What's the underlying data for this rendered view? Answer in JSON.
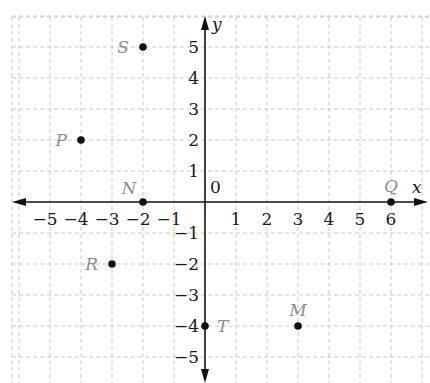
{
  "chart_data": {
    "type": "scatter",
    "title": "",
    "xlabel": "x",
    "ylabel": "y",
    "xlim": [
      -6,
      7
    ],
    "ylim": [
      -6,
      6
    ],
    "grid": true,
    "origin_label": "0",
    "x_ticks": [
      -5,
      -4,
      -3,
      -2,
      -1,
      1,
      2,
      3,
      4,
      5,
      6
    ],
    "y_ticks": [
      5,
      4,
      3,
      2,
      1,
      -1,
      -2,
      -3,
      -4,
      -5
    ],
    "x_tick_labels": [
      "-5",
      "-4",
      "-3",
      "-2",
      "-1",
      "1",
      "2",
      "3",
      "4",
      "5",
      "6"
    ],
    "y_tick_labels": [
      "5",
      "4",
      "3",
      "2",
      "1",
      "-1",
      "-2",
      "-3",
      "-4",
      "-5"
    ],
    "points": [
      {
        "label": "S",
        "x": -2,
        "y": 5,
        "label_pos": "left"
      },
      {
        "label": "P",
        "x": -4,
        "y": 2,
        "label_pos": "left"
      },
      {
        "label": "N",
        "x": -2,
        "y": 0,
        "label_pos": "above-left"
      },
      {
        "label": "Q",
        "x": 6,
        "y": 0,
        "label_pos": "above"
      },
      {
        "label": "R",
        "x": -3,
        "y": -2,
        "label_pos": "left"
      },
      {
        "label": "T",
        "x": 0,
        "y": -4,
        "label_pos": "right"
      },
      {
        "label": "M",
        "x": 3,
        "y": -4,
        "label_pos": "above"
      }
    ]
  },
  "colors": {
    "axis": "#111111",
    "grid": "#c8c8c8",
    "point": "#111111",
    "point_label": "#8c8c8c",
    "tick_label": "#1a1a1a"
  }
}
